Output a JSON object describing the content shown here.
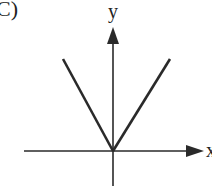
{
  "figure": {
    "panel_label": "C)",
    "axis_labels": {
      "x": "x",
      "y": "y"
    }
  },
  "colors": {
    "line": "#2a2a2a",
    "background": "#ffffff"
  }
}
